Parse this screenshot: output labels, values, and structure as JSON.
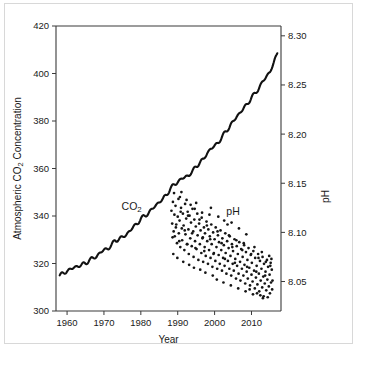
{
  "chart_data": {
    "type": "line",
    "title": "",
    "xlabel": "Year",
    "ylabel": "Atmospheric CO2 Concentration",
    "ylabel_parts": {
      "pre": "Atmospheric CO",
      "sub": "2",
      "post": " Concentration"
    },
    "y2label": "pH",
    "xlim": [
      1957,
      2018
    ],
    "ylim": [
      300,
      420
    ],
    "y2lim": [
      8.02,
      8.31
    ],
    "grid": false,
    "legend_position": "inline-annotations",
    "xticks": [
      1960,
      1970,
      1980,
      1990,
      2000,
      2010
    ],
    "xticklabels": [
      "1960",
      "1970",
      "1980",
      "1990",
      "2000",
      "2010"
    ],
    "yticks": [
      300,
      320,
      340,
      360,
      380,
      400,
      420
    ],
    "yticklabels": [
      "300",
      "320",
      "340",
      "360",
      "380",
      "400",
      "420"
    ],
    "y2ticks": [
      8.05,
      8.1,
      8.15,
      8.2,
      8.25,
      8.3
    ],
    "y2ticklabels": [
      "8.05",
      "8.10",
      "8.15",
      "8.20",
      "8.25",
      "8.30"
    ],
    "annotations": [
      {
        "text": "CO2",
        "text_pre": "CO",
        "text_sub": "2",
        "x": 1977.5,
        "y_value": 342.5,
        "axis": "left"
      },
      {
        "text": "pH",
        "x": 2005.0,
        "y_value": 8.118,
        "axis": "right"
      }
    ],
    "series": [
      {
        "name": "CO2",
        "type": "line",
        "axis": "left",
        "units": "ppm",
        "x": [
          1958,
          1959,
          1960,
          1961,
          1962,
          1963,
          1964,
          1965,
          1966,
          1967,
          1968,
          1969,
          1970,
          1971,
          1972,
          1973,
          1974,
          1975,
          1976,
          1977,
          1978,
          1979,
          1980,
          1981,
          1982,
          1983,
          1984,
          1985,
          1986,
          1987,
          1988,
          1989,
          1990,
          1991,
          1992,
          1993,
          1994,
          1995,
          1996,
          1997,
          1998,
          1999,
          2000,
          2001,
          2002,
          2003,
          2004,
          2005,
          2006,
          2007,
          2008,
          2009,
          2010,
          2011,
          2012,
          2013,
          2014,
          2015,
          2016,
          2017
        ],
        "values": [
          315.0,
          315.8,
          316.9,
          317.6,
          318.4,
          318.9,
          319.5,
          320.0,
          321.4,
          322.2,
          323.0,
          324.6,
          325.7,
          326.3,
          327.5,
          329.7,
          330.2,
          331.1,
          332.0,
          333.8,
          335.4,
          336.8,
          338.8,
          340.0,
          341.1,
          342.8,
          344.4,
          345.9,
          347.2,
          349.0,
          351.5,
          353.1,
          354.4,
          355.6,
          356.4,
          357.1,
          358.8,
          360.8,
          362.6,
          363.8,
          366.6,
          368.3,
          369.5,
          371.0,
          373.1,
          375.6,
          377.4,
          379.7,
          381.9,
          383.7,
          385.6,
          387.4,
          389.9,
          391.6,
          393.8,
          396.5,
          398.6,
          400.8,
          404.2,
          408.5
        ]
      },
      {
        "name": "pH",
        "type": "scatter",
        "axis": "right",
        "units": "pH units",
        "note": "Ocean surface seawater pH measurements, roughly monthly, 1988-2015",
        "points": [
          [
            1988.3,
            8.122
          ],
          [
            1988.5,
            8.109
          ],
          [
            1988.7,
            8.131
          ],
          [
            1988.9,
            8.101
          ],
          [
            1989.1,
            8.118
          ],
          [
            1989.2,
            8.096
          ],
          [
            1989.4,
            8.127
          ],
          [
            1989.6,
            8.108
          ],
          [
            1989.8,
            8.089
          ],
          [
            1990.0,
            8.116
          ],
          [
            1990.2,
            8.134
          ],
          [
            1990.3,
            8.099
          ],
          [
            1990.5,
            8.112
          ],
          [
            1990.7,
            8.085
          ],
          [
            1990.9,
            8.125
          ],
          [
            1991.1,
            8.104
          ],
          [
            1991.2,
            8.092
          ],
          [
            1991.4,
            8.119
          ],
          [
            1991.6,
            8.107
          ],
          [
            1991.8,
            8.082
          ],
          [
            1992.0,
            8.129
          ],
          [
            1992.1,
            8.098
          ],
          [
            1992.3,
            8.114
          ],
          [
            1992.5,
            8.088
          ],
          [
            1992.7,
            8.121
          ],
          [
            1992.9,
            8.103
          ],
          [
            1993.0,
            8.078
          ],
          [
            1993.2,
            8.117
          ],
          [
            1993.4,
            8.094
          ],
          [
            1993.6,
            8.11
          ],
          [
            1993.8,
            8.086
          ],
          [
            1994.0,
            8.124
          ],
          [
            1994.2,
            8.101
          ],
          [
            1994.3,
            8.075
          ],
          [
            1994.5,
            8.113
          ],
          [
            1994.7,
            8.091
          ],
          [
            1994.9,
            8.106
          ],
          [
            1995.1,
            8.083
          ],
          [
            1995.3,
            8.119
          ],
          [
            1995.4,
            8.097
          ],
          [
            1995.6,
            8.072
          ],
          [
            1995.8,
            8.109
          ],
          [
            1996.0,
            8.088
          ],
          [
            1996.2,
            8.102
          ],
          [
            1996.4,
            8.079
          ],
          [
            1996.5,
            8.115
          ],
          [
            1996.7,
            8.094
          ],
          [
            1996.9,
            8.07
          ],
          [
            1997.1,
            8.105
          ],
          [
            1997.3,
            8.085
          ],
          [
            1997.4,
            8.099
          ],
          [
            1997.6,
            8.076
          ],
          [
            1997.8,
            8.111
          ],
          [
            1998.0,
            8.091
          ],
          [
            1998.2,
            8.068
          ],
          [
            1998.3,
            8.103
          ],
          [
            1998.5,
            8.082
          ],
          [
            1998.7,
            8.096
          ],
          [
            1998.9,
            8.074
          ],
          [
            1999.1,
            8.108
          ],
          [
            1999.2,
            8.088
          ],
          [
            1999.4,
            8.065
          ],
          [
            1999.6,
            8.1
          ],
          [
            1999.8,
            8.079
          ],
          [
            2000.0,
            8.093
          ],
          [
            2000.2,
            8.071
          ],
          [
            2000.3,
            8.105
          ],
          [
            2000.5,
            8.085
          ],
          [
            2000.7,
            8.063
          ],
          [
            2000.9,
            8.097
          ],
          [
            2001.1,
            8.077
          ],
          [
            2001.2,
            8.09
          ],
          [
            2001.4,
            8.068
          ],
          [
            2001.6,
            8.102
          ],
          [
            2001.8,
            8.082
          ],
          [
            2002.0,
            8.061
          ],
          [
            2002.1,
            8.094
          ],
          [
            2002.3,
            8.074
          ],
          [
            2002.5,
            8.087
          ],
          [
            2002.7,
            8.066
          ],
          [
            2002.9,
            8.099
          ],
          [
            2003.0,
            8.079
          ],
          [
            2003.2,
            8.058
          ],
          [
            2003.4,
            8.091
          ],
          [
            2003.6,
            8.071
          ],
          [
            2003.8,
            8.084
          ],
          [
            2004.0,
            8.063
          ],
          [
            2004.1,
            8.096
          ],
          [
            2004.3,
            8.076
          ],
          [
            2004.5,
            8.056
          ],
          [
            2004.7,
            8.088
          ],
          [
            2004.9,
            8.068
          ],
          [
            2005.0,
            8.081
          ],
          [
            2005.2,
            8.061
          ],
          [
            2005.4,
            8.093
          ],
          [
            2005.6,
            8.073
          ],
          [
            2005.8,
            8.053
          ],
          [
            2006.0,
            8.086
          ],
          [
            2006.1,
            8.066
          ],
          [
            2006.3,
            8.078
          ],
          [
            2006.5,
            8.058
          ],
          [
            2006.7,
            8.09
          ],
          [
            2006.9,
            8.07
          ],
          [
            2007.0,
            8.051
          ],
          [
            2007.2,
            8.083
          ],
          [
            2007.4,
            8.063
          ],
          [
            2007.6,
            8.075
          ],
          [
            2007.8,
            8.056
          ],
          [
            2008.0,
            8.087
          ],
          [
            2008.1,
            8.067
          ],
          [
            2008.3,
            8.048
          ],
          [
            2008.5,
            8.08
          ],
          [
            2008.7,
            8.06
          ],
          [
            2008.9,
            8.072
          ],
          [
            2009.0,
            8.053
          ],
          [
            2009.2,
            8.084
          ],
          [
            2009.4,
            8.064
          ],
          [
            2009.6,
            8.046
          ],
          [
            2009.8,
            8.077
          ],
          [
            2010.0,
            8.057
          ],
          [
            2010.1,
            8.069
          ],
          [
            2010.3,
            8.05
          ],
          [
            2010.5,
            8.081
          ],
          [
            2010.7,
            8.061
          ],
          [
            2010.9,
            8.043
          ],
          [
            2011.0,
            8.074
          ],
          [
            2011.2,
            8.054
          ],
          [
            2011.4,
            8.066
          ],
          [
            2011.6,
            8.047
          ],
          [
            2011.8,
            8.078
          ],
          [
            2012.0,
            8.058
          ],
          [
            2012.1,
            8.04
          ],
          [
            2012.3,
            8.071
          ],
          [
            2012.5,
            8.051
          ],
          [
            2012.7,
            8.063
          ],
          [
            2012.9,
            8.044
          ],
          [
            2013.0,
            8.075
          ],
          [
            2013.2,
            8.055
          ],
          [
            2013.4,
            8.068
          ],
          [
            2013.6,
            8.048
          ],
          [
            2013.8,
            8.06
          ],
          [
            2014.0,
            8.041
          ],
          [
            2014.2,
            8.072
          ],
          [
            2014.3,
            8.052
          ],
          [
            2014.5,
            8.065
          ],
          [
            2014.7,
            8.045
          ],
          [
            2014.9,
            8.057
          ],
          [
            2015.0,
            8.038
          ],
          [
            2015.2,
            8.069
          ],
          [
            2015.3,
            8.049
          ],
          [
            2015.5,
            8.062
          ],
          [
            2015.6,
            8.042
          ],
          [
            1989.0,
            8.14
          ],
          [
            1990.6,
            8.136
          ],
          [
            1992.4,
            8.133
          ],
          [
            1993.5,
            8.128
          ],
          [
            1991.0,
            8.141
          ],
          [
            1994.6,
            8.124
          ],
          [
            1995.0,
            8.13
          ],
          [
            1996.6,
            8.12
          ],
          [
            1998.6,
            8.118
          ],
          [
            1999.0,
            8.125
          ],
          [
            2001.0,
            8.116
          ],
          [
            2002.6,
            8.112
          ],
          [
            2003.5,
            8.108
          ],
          [
            2004.6,
            8.11
          ],
          [
            2006.6,
            8.104
          ],
          [
            2008.6,
            8.098
          ],
          [
            1988.8,
            8.078
          ],
          [
            1989.9,
            8.074
          ],
          [
            1991.5,
            8.07
          ],
          [
            1993.1,
            8.067
          ],
          [
            1994.4,
            8.064
          ],
          [
            1996.1,
            8.062
          ],
          [
            1997.5,
            8.059
          ],
          [
            1999.5,
            8.056
          ],
          [
            2000.6,
            8.052
          ],
          [
            2002.4,
            8.049
          ],
          [
            2004.4,
            8.046
          ],
          [
            2006.4,
            8.043
          ],
          [
            2008.4,
            8.04
          ],
          [
            2010.4,
            8.037
          ],
          [
            2012.4,
            8.036
          ],
          [
            2014.4,
            8.034
          ],
          [
            2013.1,
            8.033
          ],
          [
            2013.3,
            8.035
          ],
          [
            2011.5,
            8.038
          ],
          [
            2009.5,
            8.042
          ],
          [
            1990.8,
            8.121
          ],
          [
            1992.8,
            8.117
          ],
          [
            1995.9,
            8.113
          ],
          [
            1997.9,
            8.107
          ],
          [
            2000.8,
            8.101
          ],
          [
            2003.9,
            8.097
          ],
          [
            2005.9,
            8.092
          ],
          [
            2007.9,
            8.089
          ],
          [
            2010.8,
            8.085
          ],
          [
            2012.8,
            8.08
          ],
          [
            2014.8,
            8.076
          ],
          [
            2015.4,
            8.073
          ],
          [
            1989.5,
            8.105
          ],
          [
            1991.9,
            8.102
          ],
          [
            1993.9,
            8.099
          ],
          [
            1996.8,
            8.095
          ],
          [
            1998.8,
            8.093
          ],
          [
            2001.9,
            8.089
          ],
          [
            2004.8,
            8.085
          ],
          [
            2007.5,
            8.082
          ],
          [
            2009.9,
            8.078
          ],
          [
            2011.9,
            8.074
          ],
          [
            2013.9,
            8.07
          ],
          [
            2015.1,
            8.066
          ],
          [
            1988.6,
            8.095
          ],
          [
            1990.4,
            8.091
          ],
          [
            1992.6,
            8.088
          ],
          [
            1994.8,
            8.084
          ],
          [
            1997.2,
            8.081
          ],
          [
            1999.7,
            8.078
          ],
          [
            2002.8,
            8.073
          ],
          [
            2005.5,
            8.069
          ],
          [
            2008.8,
            8.065
          ],
          [
            2011.3,
            8.06
          ],
          [
            2013.7,
            8.056
          ],
          [
            2015.7,
            8.051
          ]
        ]
      }
    ]
  }
}
